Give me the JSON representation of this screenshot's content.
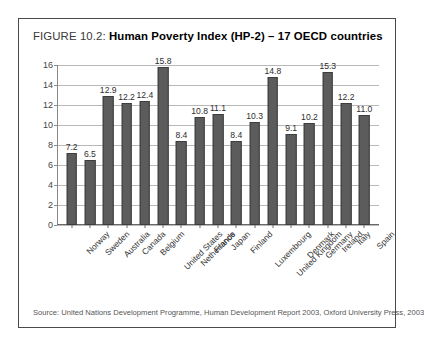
{
  "figure": {
    "label": "FIGURE 10.2:",
    "title_bold": "Human Poverty Index (HP-2) – 17 OECD countries",
    "source": "Source: United Nations Development Programme, Human Development Report 2003, Oxford University Press, 2003"
  },
  "colors": {
    "bar_fill": "#5c5c5c",
    "bar_border": "#3d3d3d",
    "gridline": "#b8b8b8",
    "frame": "#4a4a4a",
    "text": "#1a1a1a"
  },
  "chart_data": {
    "type": "bar",
    "title": "FIGURE 10.2: Human Poverty Index (HP-2) – 17 OECD countries",
    "xlabel": "",
    "ylabel": "",
    "ylim": [
      0,
      16
    ],
    "yticks": [
      0,
      2,
      4,
      6,
      8,
      10,
      12,
      14,
      16
    ],
    "ytick_labels": [
      "0",
      "2",
      "4",
      "6",
      "8",
      "10",
      "12",
      "14",
      "16"
    ],
    "grid": true,
    "legend": "none",
    "categories": [
      "Norway",
      "Sweden",
      "Australia",
      "Canada",
      "Belgium",
      "United States",
      "Netherlands",
      "France",
      "Japan",
      "Finland",
      "Luxembourg",
      "United Kingdom",
      "Denmark",
      "Germany",
      "Ireland",
      "Italy",
      "Spain"
    ],
    "values": [
      7.2,
      6.5,
      12.9,
      12.2,
      12.4,
      15.8,
      8.4,
      10.8,
      11.1,
      8.4,
      10.3,
      14.8,
      9.1,
      10.2,
      15.3,
      12.2,
      11.0
    ],
    "value_labels": [
      "7.2",
      "6.5",
      "12.9",
      "12.2",
      "12.4",
      "15.8",
      "8.4",
      "10.8",
      "11.1",
      "8.4",
      "10.3",
      "14.8",
      "9.1",
      "10.2",
      "15.3",
      "12.2",
      "11.0"
    ]
  }
}
